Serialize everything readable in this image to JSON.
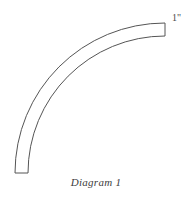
{
  "figure": {
    "caption": "Diagram 1",
    "dimension_label": "1\"",
    "background_color": "#ffffff",
    "stroke_color": "#555555",
    "fill_color": "#ffffff",
    "stroke_width": 1
  },
  "geometry": {
    "shape_type": "quarter-annulus",
    "description": "curved band / pipe elbow sweeping 90 degrees",
    "arc_center_x": 165,
    "arc_center_y": 173,
    "outer_radius": 150,
    "inner_radius": 137,
    "start_angle_deg": 180,
    "end_angle_deg": 90,
    "band_width": 13,
    "bottom_end": {
      "outer_x": 15,
      "inner_x": 28,
      "y": 173,
      "cut": "horizontal"
    },
    "top_end": {
      "x": 165,
      "outer_y": 23,
      "inner_y": 36,
      "cut": "vertical"
    },
    "outer_path": "M 15 173 A 150 150 0 0 1 165 23",
    "inner_path": "M 28 173 A 137 137 0 0 1 165 36"
  }
}
